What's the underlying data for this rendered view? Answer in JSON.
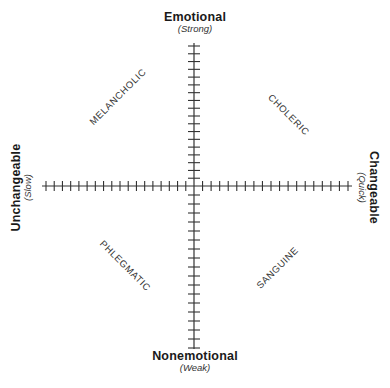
{
  "diagram": {
    "type": "quadrant-diagram",
    "axes": {
      "vertical": {
        "top": {
          "label": "Emotional",
          "sublabel": "(Strong)"
        },
        "bottom": {
          "label": "Nonemotional",
          "sublabel": "(Weak)"
        },
        "ticks_per_half": 18
      },
      "horizontal": {
        "left": {
          "label": "Unchangeable",
          "sublabel": "(Slow)"
        },
        "right": {
          "label": "Changeable",
          "sublabel": "(Quick)"
        },
        "ticks_per_half": 18
      }
    },
    "quadrants": {
      "top_left": "MELANCHOLIC",
      "top_right": "CHOLERIC",
      "bottom_left": "PHLEGMATIC",
      "bottom_right": "SANGUINE"
    },
    "colors": {
      "line": "#333333",
      "text": "#1a1a1a",
      "background": "#ffffff"
    }
  }
}
